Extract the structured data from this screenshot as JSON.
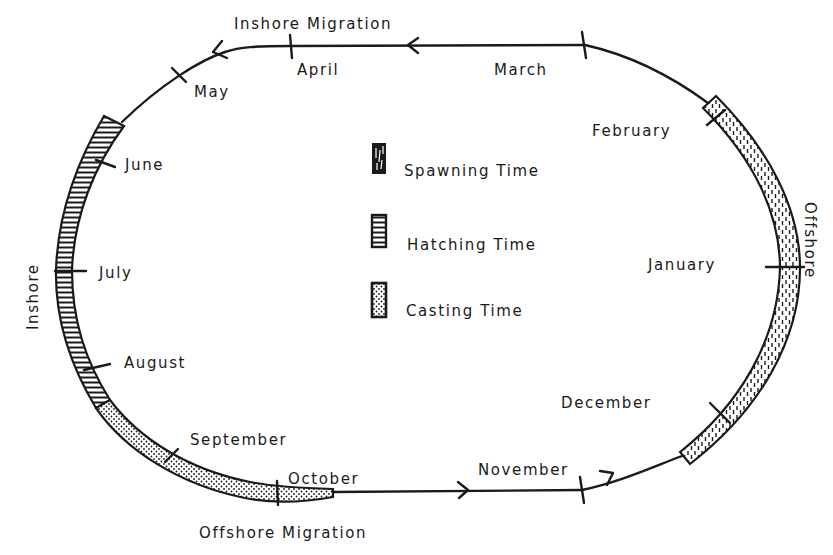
{
  "diagram": {
    "type": "annual-cycle",
    "labels": {
      "inshore_migration": "Inshore Migration",
      "offshore_migration": "Offshore Migration",
      "inshore": "Inshore",
      "offshore": "Offshore"
    },
    "months": [
      {
        "name": "January",
        "id": "january"
      },
      {
        "name": "February",
        "id": "february"
      },
      {
        "name": "March",
        "id": "march"
      },
      {
        "name": "April",
        "id": "april"
      },
      {
        "name": "May",
        "id": "may"
      },
      {
        "name": "June",
        "id": "june"
      },
      {
        "name": "July",
        "id": "july"
      },
      {
        "name": "August",
        "id": "august"
      },
      {
        "name": "September",
        "id": "september"
      },
      {
        "name": "October",
        "id": "october"
      },
      {
        "name": "November",
        "id": "november"
      },
      {
        "name": "December",
        "id": "december"
      }
    ],
    "legend": [
      {
        "label": "Spawning Time",
        "pattern": "spawning",
        "icon": "dashes-pattern"
      },
      {
        "label": "Hatching Time",
        "pattern": "hatching",
        "icon": "horizontal-stripes-pattern"
      },
      {
        "label": "Casting Time",
        "pattern": "casting",
        "icon": "dots-pattern"
      }
    ],
    "periods": [
      {
        "phase": "Spawning Time",
        "from": "early February",
        "to": "mid December",
        "side": "Offshore"
      },
      {
        "phase": "Hatching Time",
        "from": "late May",
        "to": "late August",
        "side": "Inshore"
      },
      {
        "phase": "Casting Time",
        "from": "late August",
        "to": "mid October",
        "side": "Inshore"
      }
    ],
    "flow_direction": "counter-clockwise (March → April → May ... → February)",
    "colors": {
      "ink": "#1a1a1a",
      "paper": "#ffffff"
    }
  }
}
